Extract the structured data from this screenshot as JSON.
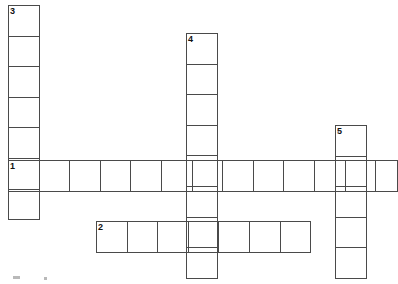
{
  "puzzle": {
    "kind": "crossword-grid",
    "cell_size": 30.6,
    "border_color": "#4a4a4a",
    "background_color": "#ffffff",
    "number_color": "#111111",
    "width": 398,
    "height": 284,
    "entries": [
      {
        "number": "1",
        "direction": "across",
        "x": 8,
        "y": 160,
        "cells": 13,
        "clipped_right": true,
        "letters": [
          "",
          "",
          "",
          "",
          "",
          "",
          "",
          "",
          "",
          "",
          "",
          "",
          ""
        ]
      },
      {
        "number": "2",
        "direction": "across",
        "x": 96,
        "y": 221,
        "cells": 7,
        "clipped_right": false,
        "letters": [
          "",
          "",
          "",
          "",
          "",
          "",
          ""
        ]
      },
      {
        "number": "3",
        "direction": "down",
        "x": 8,
        "y": 5,
        "cells": 7,
        "clipped_bottom": false,
        "letters": [
          "",
          "",
          "",
          "",
          "",
          "",
          ""
        ]
      },
      {
        "number": "4",
        "direction": "down",
        "x": 186,
        "y": 33,
        "cells": 8,
        "clipped_bottom": true,
        "letters": [
          "",
          "",
          "",
          "",
          "",
          "",
          "",
          ""
        ]
      },
      {
        "number": "5",
        "direction": "down",
        "x": 335,
        "y": 125,
        "cells": 5,
        "clipped_bottom": true,
        "letters": [
          "",
          "",
          "",
          "",
          ""
        ]
      }
    ],
    "artifacts": [
      {
        "x": 13,
        "y": 276,
        "width": 7,
        "height": 3
      },
      {
        "x": 44,
        "y": 277,
        "width": 3,
        "height": 3
      }
    ]
  }
}
